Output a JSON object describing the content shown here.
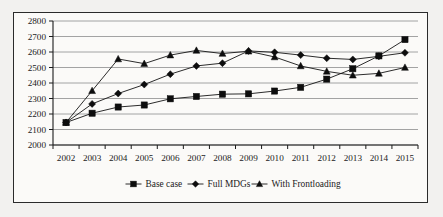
{
  "chart_data": {
    "type": "line",
    "title": "",
    "xlabel": "",
    "ylabel": "",
    "x": [
      2002,
      2003,
      2004,
      2005,
      2006,
      2007,
      2008,
      2009,
      2010,
      2011,
      2012,
      2013,
      2014,
      2015
    ],
    "categories": [
      "2002",
      "2003",
      "2004",
      "2005",
      "2006",
      "2007",
      "2008",
      "2009",
      "2010",
      "2011",
      "2012",
      "2013",
      "2014",
      "2015"
    ],
    "ylim": [
      2000,
      2800
    ],
    "ytick_step": 100,
    "yticks": [
      "2000",
      "2100",
      "2200",
      "2300",
      "2400",
      "2500",
      "2600",
      "2700",
      "2800"
    ],
    "grid": true,
    "legend_position": "bottom",
    "series": [
      {
        "name": "Base case",
        "marker": "square",
        "color": "#0d0d0d",
        "values": [
          2145,
          2205,
          2245,
          2258,
          2298,
          2313,
          2328,
          2330,
          2348,
          2372,
          2425,
          2492,
          2575,
          2680
        ]
      },
      {
        "name": "Full MDGs",
        "marker": "diamond",
        "color": "#0d0d0d",
        "values": [
          2145,
          2265,
          2332,
          2390,
          2457,
          2510,
          2528,
          2607,
          2598,
          2580,
          2560,
          2552,
          2572,
          2595
        ]
      },
      {
        "name": "With Frontloading",
        "marker": "triangle",
        "color": "#0d0d0d",
        "values": [
          2145,
          2350,
          2555,
          2525,
          2580,
          2610,
          2590,
          2605,
          2568,
          2510,
          2475,
          2450,
          2462,
          2500
        ]
      }
    ]
  },
  "legend": {
    "items": [
      {
        "label": "Base case",
        "marker": "square"
      },
      {
        "label": "Full MDGs",
        "marker": "diamond"
      },
      {
        "label": "With Frontloading",
        "marker": "triangle"
      }
    ]
  }
}
